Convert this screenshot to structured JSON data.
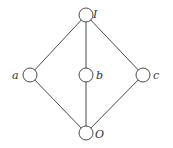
{
  "diagram": {
    "type": "hasse-diagram",
    "nodes": [
      {
        "id": "I",
        "label": "I",
        "x": 86,
        "y": 15,
        "lx": 93,
        "ly": 17
      },
      {
        "id": "a",
        "label": "a",
        "x": 30,
        "y": 75,
        "lx": 14,
        "ly": 79
      },
      {
        "id": "b",
        "label": "b",
        "x": 86,
        "y": 75,
        "lx": 96,
        "ly": 79
      },
      {
        "id": "c",
        "label": "c",
        "x": 143,
        "y": 75,
        "lx": 153,
        "ly": 79
      },
      {
        "id": "O",
        "label": "O",
        "x": 86,
        "y": 133,
        "lx": 95,
        "ly": 137
      }
    ],
    "edges": [
      [
        "I",
        "a"
      ],
      [
        "I",
        "b"
      ],
      [
        "I",
        "c"
      ],
      [
        "a",
        "O"
      ],
      [
        "b",
        "O"
      ],
      [
        "c",
        "O"
      ]
    ],
    "node_radius": 7,
    "colors": {
      "stroke": "#4a4a4a",
      "fill": "#ffffff",
      "text": "#333333"
    }
  }
}
